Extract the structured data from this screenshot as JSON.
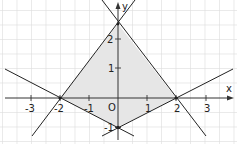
{
  "figure": {
    "type": "coordinate-plane",
    "axes": {
      "x_label": "x",
      "y_label": "y",
      "origin_label": "O",
      "x_ticks": [
        "-3",
        "-2",
        "-1",
        "1",
        "2",
        "3"
      ],
      "y_ticks": [
        "2",
        "1",
        "-1"
      ]
    },
    "lines": [
      {
        "name": "line-1",
        "through": [
          [
            -2,
            0
          ],
          [
            0,
            2.5
          ]
        ]
      },
      {
        "name": "line-2",
        "through": [
          [
            2,
            0
          ],
          [
            0,
            2.5
          ]
        ]
      },
      {
        "name": "line-3",
        "through": [
          [
            -2,
            0
          ],
          [
            0,
            -1
          ]
        ]
      },
      {
        "name": "line-4",
        "through": [
          [
            2,
            0
          ],
          [
            0,
            -1
          ]
        ]
      }
    ],
    "shaded_region": {
      "vertices": [
        [
          -2,
          0
        ],
        [
          0,
          2.5
        ],
        [
          2,
          0
        ],
        [
          0,
          -1
        ]
      ],
      "fill": "#e6e6e6"
    },
    "colors": {
      "grid": "#dcdcdc",
      "axis": "#333333",
      "line": "#222222"
    }
  }
}
